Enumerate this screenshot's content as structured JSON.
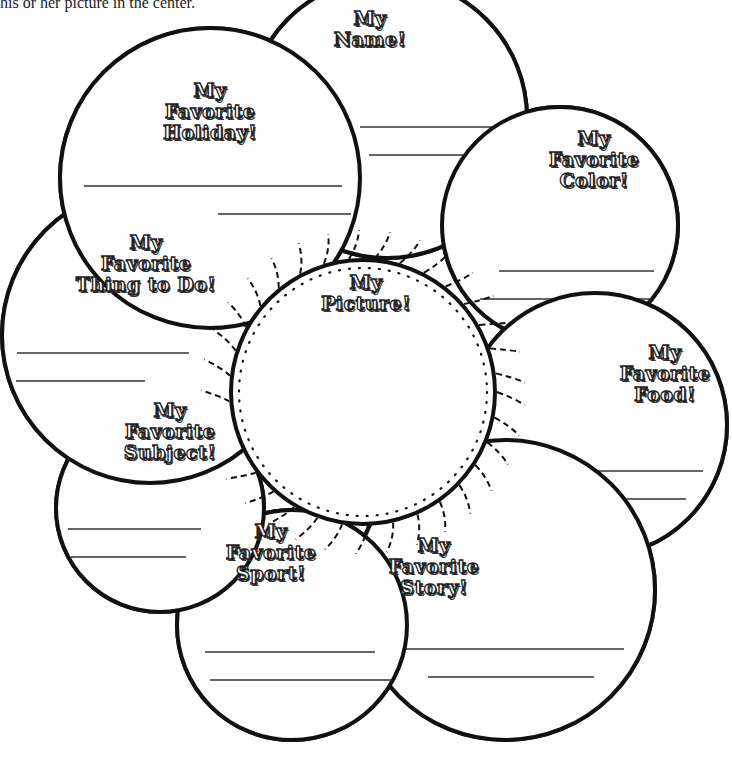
{
  "intro_text": "his or her picture in the center.",
  "petals": [
    {
      "id": "name",
      "lines": [
        "My",
        "Name!"
      ],
      "label_pos": [
        370,
        8
      ],
      "center": [
        387,
        118
      ],
      "r": 140,
      "write_lines": [
        [
          360,
          127,
          510,
          127
        ],
        [
          369,
          155,
          512,
          155
        ]
      ]
    },
    {
      "id": "holiday",
      "lines": [
        "My",
        "Favorite",
        "Holiday!"
      ],
      "label_pos": [
        210,
        80
      ],
      "center": [
        210,
        178
      ],
      "r": 150,
      "write_lines": [
        [
          84,
          186,
          342,
          186
        ],
        [
          218,
          214,
          351,
          214
        ]
      ]
    },
    {
      "id": "color",
      "lines": [
        "My",
        "Favorite",
        "Color!"
      ],
      "label_pos": [
        594,
        128
      ],
      "center": [
        560,
        225
      ],
      "r": 118,
      "write_lines": [
        [
          499,
          271,
          654,
          271
        ],
        [
          480,
          299,
          652,
          299
        ]
      ]
    },
    {
      "id": "thing_to_do",
      "lines": [
        "My",
        "Favorite",
        "Thing to Do!"
      ],
      "label_pos": [
        146,
        232
      ],
      "center": [
        150,
        335
      ],
      "r": 148,
      "write_lines": [
        [
          17,
          353,
          189,
          353
        ],
        [
          16,
          381,
          145,
          381
        ]
      ]
    },
    {
      "id": "food",
      "lines": [
        "My",
        "Favorite",
        "Food!"
      ],
      "label_pos": [
        665,
        342
      ],
      "center": [
        595,
        425
      ],
      "r": 132,
      "write_lines": [
        [
          489,
          471,
          703,
          471
        ],
        [
          468,
          499,
          686,
          499
        ]
      ]
    },
    {
      "id": "subject",
      "lines": [
        "My",
        "Favorite",
        "Subject!"
      ],
      "label_pos": [
        170,
        400
      ],
      "center": [
        160,
        508
      ],
      "r": 104,
      "write_lines": [
        [
          68,
          529,
          201,
          529
        ],
        [
          71,
          557,
          186,
          557
        ]
      ]
    },
    {
      "id": "sport",
      "lines": [
        "My",
        "Favorite",
        "Sport!"
      ],
      "label_pos": [
        271,
        521
      ],
      "center": [
        292,
        625
      ],
      "r": 115,
      "write_lines": [
        [
          205,
          652,
          375,
          652
        ],
        [
          210,
          680,
          392,
          680
        ]
      ]
    },
    {
      "id": "story",
      "lines": [
        "My",
        "Favorite",
        "Story!"
      ],
      "label_pos": [
        434,
        535
      ],
      "center": [
        505,
        590
      ],
      "r": 150,
      "write_lines": [
        [
          393,
          649,
          624,
          649
        ],
        [
          428,
          677,
          594,
          677
        ]
      ]
    }
  ],
  "center_circle": {
    "id": "picture",
    "lines": [
      "My",
      "Picture!"
    ],
    "label_pos": [
      366,
      272
    ],
    "center": [
      363,
      392
    ],
    "r": 132
  },
  "colors": {
    "ink": "#111111",
    "paper": "#fefefe"
  }
}
